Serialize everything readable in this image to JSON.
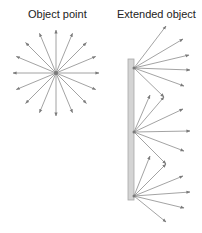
{
  "labels": {
    "object_point": "Object point",
    "extended_object": "Extended object"
  },
  "colors": {
    "ray": "#8c8c8c",
    "arrowhead": "#7a7a7a",
    "bar_fill": "#d4d4d4",
    "bar_stroke": "#a8a8a8",
    "text": "#222222"
  },
  "object_point": {
    "center": [
      56,
      73
    ],
    "ray_length": 43,
    "ray_count": 16
  },
  "extended_object": {
    "bar": {
      "x": 128,
      "y": 59,
      "width": 6,
      "height": 141
    },
    "emission_points": [
      {
        "origin": [
          134,
          68
        ],
        "rays": [
          [
            166,
            26
          ],
          [
            183,
            39
          ],
          [
            189,
            55
          ],
          [
            190,
            70
          ],
          [
            184,
            86
          ],
          [
            164,
            97
          ]
        ]
      },
      {
        "origin": [
          134,
          132
        ],
        "rays": [
          [
            150,
            95
          ],
          [
            164,
            97
          ],
          [
            183,
            109
          ],
          [
            190,
            131
          ],
          [
            184,
            151
          ],
          [
            166,
            164
          ]
        ]
      },
      {
        "origin": [
          134,
          196
        ],
        "rays": [
          [
            150,
            156
          ],
          [
            166,
            164
          ],
          [
            183,
            176
          ],
          [
            190,
            192
          ],
          [
            184,
            208
          ],
          [
            166,
            222
          ]
        ]
      }
    ]
  }
}
